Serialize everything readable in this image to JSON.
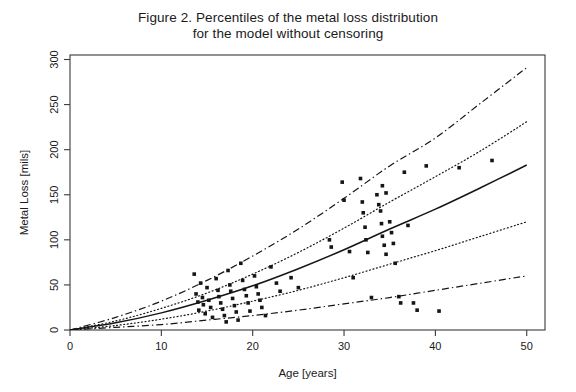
{
  "figure": {
    "title": "Figure 2. Percentiles of the metal loss distribution\nfor the model without censoring",
    "background_color": "#ffffff",
    "ink_color": "#151515"
  },
  "axes": {
    "x_title": "Age [years]",
    "y_title": "Metal Loss [mils]",
    "x_ticks": [
      "0",
      "10",
      "20",
      "30",
      "40",
      "50"
    ],
    "y_ticks": [
      "0",
      "50",
      "100",
      "150",
      "200",
      "250",
      "300"
    ]
  },
  "chart_data": {
    "type": "scatter",
    "title": "Figure 2. Percentiles of the metal loss distribution for the model without censoring",
    "xlabel": "Age [years]",
    "ylabel": "Metal Loss [mils]",
    "xlim": [
      0,
      52
    ],
    "ylim": [
      0,
      305
    ],
    "xticks": [
      0,
      10,
      20,
      30,
      40,
      50
    ],
    "yticks": [
      0,
      50,
      100,
      150,
      200,
      250,
      300
    ],
    "grid": false,
    "legend": "none",
    "frame": "box",
    "series": [
      {
        "name": "upper percentile",
        "type": "line",
        "linestyle": "dashdot",
        "x": [
          0,
          5,
          10,
          15,
          20,
          25,
          30,
          35,
          40,
          45,
          50
        ],
        "values": [
          0,
          14,
          32,
          55,
          82,
          112,
          146,
          182,
          213,
          252,
          291
        ]
      },
      {
        "name": "upper-middle percentile",
        "type": "line",
        "linestyle": "dotted",
        "x": [
          0,
          5,
          10,
          15,
          20,
          25,
          30,
          35,
          40,
          45,
          50
        ],
        "values": [
          0,
          10,
          24,
          41,
          62,
          86,
          113,
          142,
          170,
          199,
          231
        ]
      },
      {
        "name": "median",
        "type": "line",
        "linestyle": "solid",
        "x": [
          0,
          5,
          10,
          15,
          20,
          25,
          30,
          35,
          40,
          45,
          50
        ],
        "values": [
          0,
          8,
          19,
          33,
          49,
          68,
          89,
          112,
          134,
          158,
          183
        ]
      },
      {
        "name": "lower-middle percentile",
        "type": "line",
        "linestyle": "dotted",
        "x": [
          0,
          5,
          10,
          15,
          20,
          25,
          30,
          35,
          40,
          45,
          50
        ],
        "values": [
          0,
          5,
          12,
          21,
          32,
          44,
          58,
          73,
          88,
          104,
          120
        ]
      },
      {
        "name": "lower percentile",
        "type": "line",
        "linestyle": "dashdot",
        "x": [
          0,
          5,
          10,
          15,
          20,
          25,
          30,
          35,
          40,
          45,
          50
        ],
        "values": [
          0,
          3,
          6,
          11,
          16,
          22,
          29,
          36,
          44,
          52,
          60
        ]
      }
    ],
    "scatter": {
      "name": "observed metal loss",
      "marker": "square",
      "points": [
        [
          13.6,
          62
        ],
        [
          13.8,
          40
        ],
        [
          14.0,
          31
        ],
        [
          14.1,
          22
        ],
        [
          14.3,
          52
        ],
        [
          14.5,
          36
        ],
        [
          14.6,
          28
        ],
        [
          14.8,
          18
        ],
        [
          15.0,
          47
        ],
        [
          15.2,
          33
        ],
        [
          15.4,
          25
        ],
        [
          15.6,
          14
        ],
        [
          16.0,
          57
        ],
        [
          16.2,
          44
        ],
        [
          16.3,
          37
        ],
        [
          16.5,
          30
        ],
        [
          16.7,
          23
        ],
        [
          16.9,
          16
        ],
        [
          17.1,
          9
        ],
        [
          17.3,
          66
        ],
        [
          17.5,
          50
        ],
        [
          17.6,
          43
        ],
        [
          17.8,
          35
        ],
        [
          18.0,
          27
        ],
        [
          18.2,
          20
        ],
        [
          18.4,
          11
        ],
        [
          18.7,
          74
        ],
        [
          18.9,
          55
        ],
        [
          19.1,
          45
        ],
        [
          19.3,
          38
        ],
        [
          19.5,
          30
        ],
        [
          19.7,
          21
        ],
        [
          20.2,
          60
        ],
        [
          20.4,
          48
        ],
        [
          20.6,
          40
        ],
        [
          20.8,
          33
        ],
        [
          21.0,
          25
        ],
        [
          21.4,
          16
        ],
        [
          22.0,
          70
        ],
        [
          22.6,
          52
        ],
        [
          23.0,
          43
        ],
        [
          24.2,
          58
        ],
        [
          25.0,
          47
        ],
        [
          28.4,
          100
        ],
        [
          28.6,
          92
        ],
        [
          29.8,
          164
        ],
        [
          30.0,
          144
        ],
        [
          30.6,
          87
        ],
        [
          31.0,
          58
        ],
        [
          31.8,
          168
        ],
        [
          32.0,
          142
        ],
        [
          32.1,
          130
        ],
        [
          32.3,
          114
        ],
        [
          32.4,
          100
        ],
        [
          32.6,
          86
        ],
        [
          33.0,
          36
        ],
        [
          33.6,
          150
        ],
        [
          33.8,
          139
        ],
        [
          34.0,
          132
        ],
        [
          34.1,
          118
        ],
        [
          34.2,
          104
        ],
        [
          34.4,
          94
        ],
        [
          34.6,
          84
        ],
        [
          34.2,
          160
        ],
        [
          34.6,
          152
        ],
        [
          35.0,
          120
        ],
        [
          35.2,
          108
        ],
        [
          35.4,
          96
        ],
        [
          35.6,
          74
        ],
        [
          36.0,
          37
        ],
        [
          36.2,
          30
        ],
        [
          36.6,
          175
        ],
        [
          37.0,
          116
        ],
        [
          37.6,
          30
        ],
        [
          38.0,
          22
        ],
        [
          39.0,
          182
        ],
        [
          40.4,
          21
        ],
        [
          42.6,
          180
        ],
        [
          46.2,
          188
        ]
      ]
    }
  }
}
